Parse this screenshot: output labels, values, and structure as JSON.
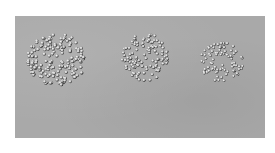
{
  "image": {
    "description": "Grayscale photograph of three clusters of small spheres (beads) on a mottled gray surface",
    "background_color": "#a9a9a9",
    "bead_highlight_color": "#f2f2f2",
    "bead_shadow_color": "#2a2a2a",
    "clusters": [
      {
        "name": "left-cluster",
        "density": "dense",
        "relative_size": "large",
        "shape": "roughly circular"
      },
      {
        "name": "middle-cluster",
        "density": "medium",
        "relative_size": "medium",
        "shape": "fan / wedge"
      },
      {
        "name": "right-cluster",
        "density": "sparse",
        "relative_size": "small",
        "shape": "irregular ring"
      }
    ]
  }
}
